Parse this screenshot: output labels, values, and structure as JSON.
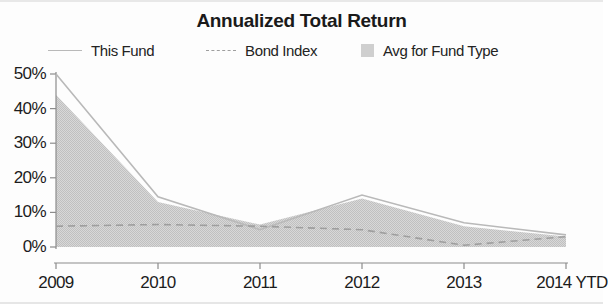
{
  "chart_data": {
    "type": "area",
    "title": "Annualized Total Return",
    "xlabel": "",
    "ylabel": "",
    "categories": [
      "2009",
      "2010",
      "2011",
      "2012",
      "2013",
      "2014 YTD"
    ],
    "ylim": [
      0,
      50
    ],
    "yticks": [
      0,
      10,
      20,
      30,
      40,
      50
    ],
    "ytick_labels": [
      "0%",
      "10%",
      "20%",
      "30%",
      "40%",
      "50%"
    ],
    "grid": false,
    "legend_position": "top",
    "series": [
      {
        "name": "This Fund",
        "style": "solid-line",
        "color": "#b9b9b9",
        "values": [
          50,
          14.5,
          5,
          15,
          7,
          3.5
        ]
      },
      {
        "name": "Bond Index",
        "style": "dashed-line",
        "color": "#9e9e9e",
        "values": [
          6,
          6.5,
          6,
          5,
          0.5,
          3
        ]
      },
      {
        "name": "Avg for Fund Type",
        "style": "filled-area",
        "color": "#cfcfcf",
        "values": [
          44,
          13,
          6.5,
          14,
          6,
          3
        ]
      }
    ]
  },
  "legend": {
    "items": [
      {
        "label": "This Fund",
        "marker": "solid-line-marker"
      },
      {
        "label": "Bond Index",
        "marker": "dashed-line-marker"
      },
      {
        "label": "Avg for Fund Type",
        "marker": "area-swatch-marker"
      }
    ]
  },
  "colors": {
    "background": "#fdfdfd",
    "axis": "#8c8c8c",
    "text": "#1a1a1a",
    "area_fill": "#cfcfcf",
    "this_fund_line": "#b9b9b9",
    "bond_index_line": "#9e9e9e"
  }
}
